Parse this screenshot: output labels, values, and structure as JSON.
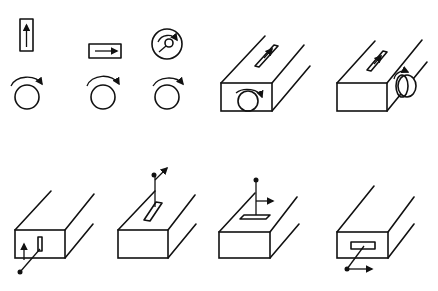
{
  "diagram": {
    "colors": {
      "line": "#111111",
      "background": "#ffffff"
    },
    "top_row": [
      {
        "id": "vertical-slider",
        "shape": "vertical rectangle with up arrow"
      },
      {
        "id": "horizontal-slider",
        "shape": "horizontal rectangle with right arrow"
      },
      {
        "id": "rotary-dial",
        "shape": "circle with pointer and clockwise arrow"
      },
      {
        "id": "knob-clockwise-1",
        "shape": "circle with clockwise arrow"
      },
      {
        "id": "knob-clockwise-2",
        "shape": "circle with clockwise arrow"
      },
      {
        "id": "knob-clockwise-3",
        "shape": "circle with clockwise arrow"
      },
      {
        "id": "box-front-knob-top-slider",
        "shape": "box with front knob and top slider"
      },
      {
        "id": "box-side-knob-top-slider",
        "shape": "box with side knob and top slider"
      }
    ],
    "bottom_row": [
      {
        "id": "box-front-vertical-slot-lever",
        "shape": "box with vertical slot on front and lever up arrow"
      },
      {
        "id": "box-top-slot-lever-forward",
        "shape": "box with top slot, lever moving forward"
      },
      {
        "id": "box-top-slot-lever-right",
        "shape": "box with top slot, lever moving right"
      },
      {
        "id": "box-front-horizontal-slot-lever",
        "shape": "box with front horizontal slot, lever moving right"
      }
    ]
  }
}
